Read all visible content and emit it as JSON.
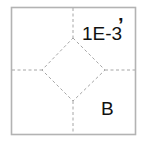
{
  "diagram": {
    "labels": {
      "top_right": "1E-3",
      "top_right_mark": "’",
      "bottom_right": "B"
    },
    "colors": {
      "frame": "#b3b3b3",
      "dashed_lines": "#a6a6a6",
      "text": "#111111",
      "background": "#ffffff"
    }
  }
}
